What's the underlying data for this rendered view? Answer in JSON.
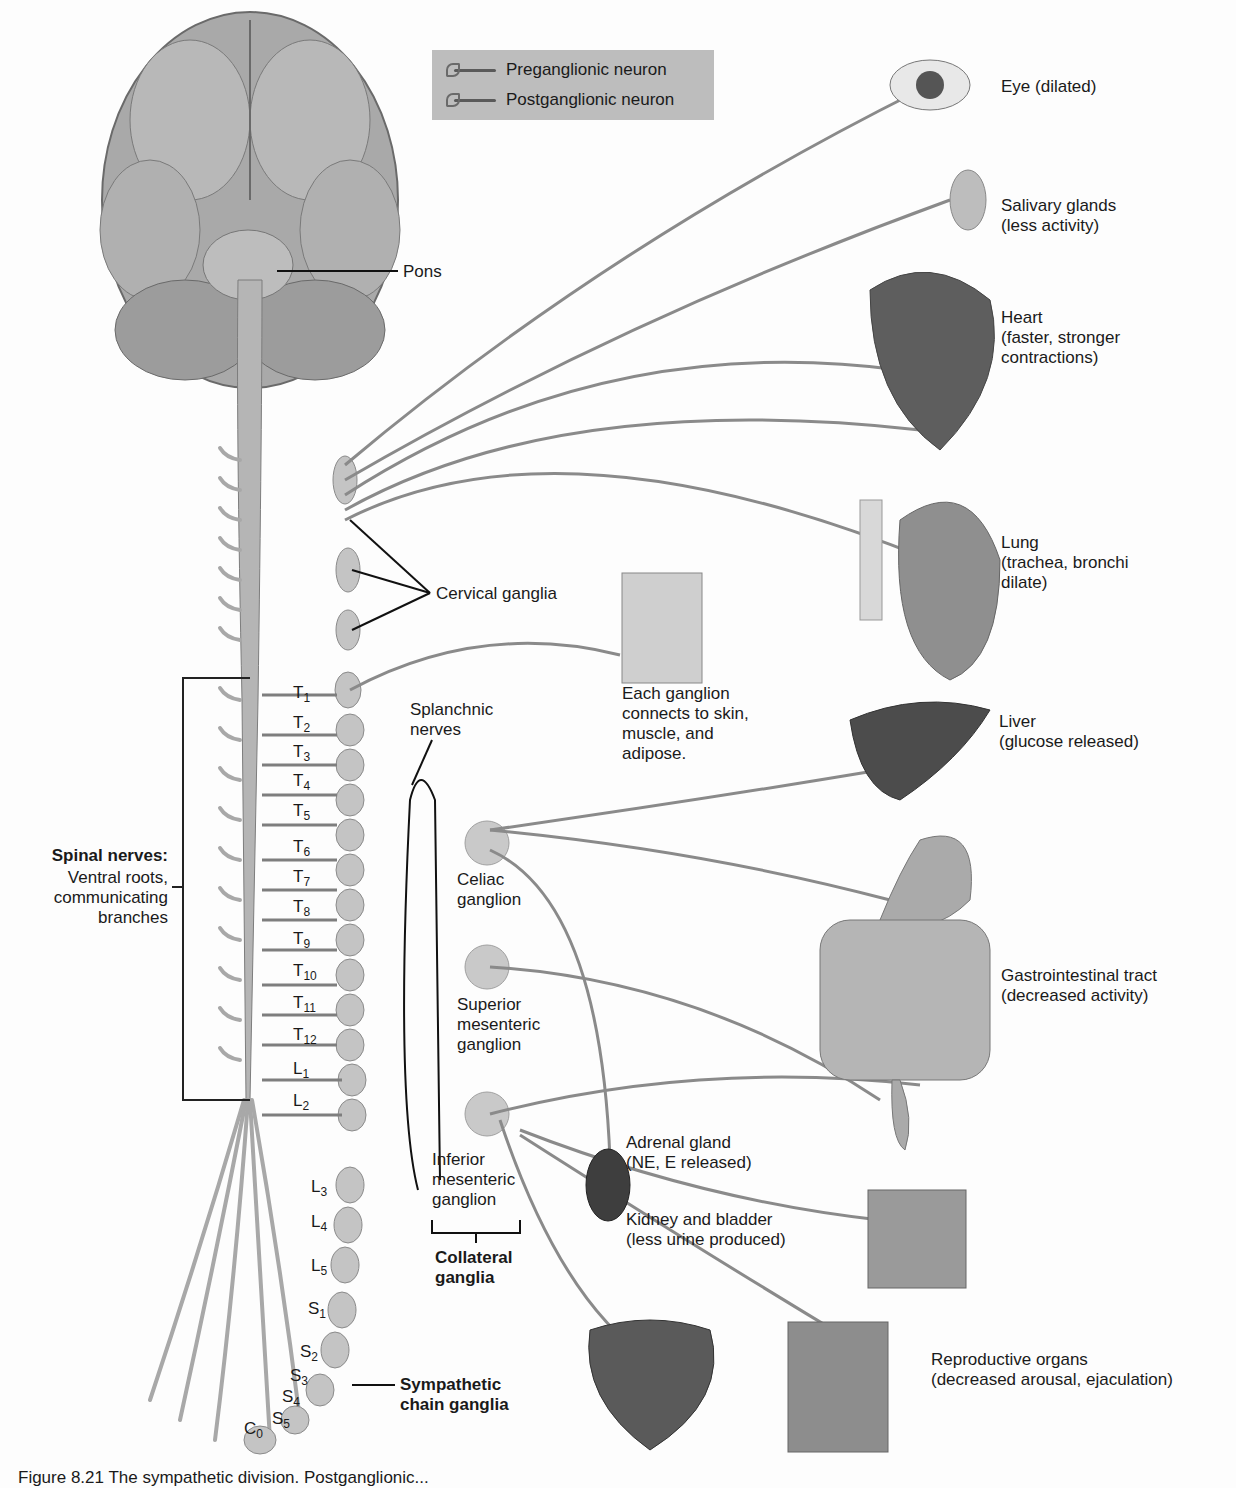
{
  "legend": {
    "items": [
      {
        "label": "Preganglionic neuron",
        "icon": "neuron-icon"
      },
      {
        "label": "Postganglionic neuron",
        "icon": "neuron-icon"
      }
    ]
  },
  "brain_labels": {
    "pons": "Pons"
  },
  "ganglia_labels": {
    "cervical": "Cervical ganglia",
    "splanchnic": "Splanchnic\nnerves",
    "celiac": "Celiac\nganglion",
    "superior_mesenteric": "Superior\nmesenteric\nganglion",
    "inferior_mesenteric": "Inferior\nmesenteric\nganglion",
    "collateral": "Collateral\nganglia",
    "sympathetic_chain": "Sympathetic\nchain ganglia",
    "skin_note": "Each ganglion\nconnects to skin,\nmuscle, and\nadipose."
  },
  "spinal_nerves": {
    "title": "Spinal nerves:",
    "subtitle": "Ventral roots,\ncommunicating\nbranches"
  },
  "segments": [
    {
      "letter": "T",
      "num": "1"
    },
    {
      "letter": "T",
      "num": "2"
    },
    {
      "letter": "T",
      "num": "3"
    },
    {
      "letter": "T",
      "num": "4"
    },
    {
      "letter": "T",
      "num": "5"
    },
    {
      "letter": "T",
      "num": "6"
    },
    {
      "letter": "T",
      "num": "7"
    },
    {
      "letter": "T",
      "num": "8"
    },
    {
      "letter": "T",
      "num": "9"
    },
    {
      "letter": "T",
      "num": "10"
    },
    {
      "letter": "T",
      "num": "11"
    },
    {
      "letter": "T",
      "num": "12"
    },
    {
      "letter": "L",
      "num": "1"
    },
    {
      "letter": "L",
      "num": "2"
    },
    {
      "letter": "L",
      "num": "3"
    },
    {
      "letter": "L",
      "num": "4"
    },
    {
      "letter": "L",
      "num": "5"
    },
    {
      "letter": "S",
      "num": "1"
    },
    {
      "letter": "S",
      "num": "2"
    },
    {
      "letter": "S",
      "num": "3"
    },
    {
      "letter": "S",
      "num": "4"
    },
    {
      "letter": "S",
      "num": "5"
    },
    {
      "letter": "C",
      "num": "0"
    }
  ],
  "organs": [
    {
      "name": "Eye (dilated)"
    },
    {
      "name": "Salivary glands\n(less activity)"
    },
    {
      "name": "Heart\n(faster, stronger\ncontractions)"
    },
    {
      "name": "Lung\n(trachea, bronchi\ndilate)"
    },
    {
      "name": "Liver\n(glucose released)"
    },
    {
      "name": "Gastrointestinal tract\n(decreased activity)"
    },
    {
      "name": "Adrenal gland\n(NE, E released)"
    },
    {
      "name": "Kidney and bladder\n(less urine produced)"
    },
    {
      "name": "Reproductive organs\n(decreased arousal, ejaculation)"
    }
  ],
  "caption": {
    "text": "Figure 8.21  The sympathetic division. Postganglionic..."
  },
  "colors": {
    "nerve": "#8a8a8a",
    "ganglion": "#c9c9c9",
    "organ": "#6b6b6b",
    "background": "#fdfdfd",
    "legend_bg": "#bdbdbd"
  }
}
